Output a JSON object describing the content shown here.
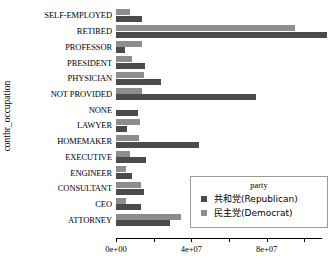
{
  "chart_data": {
    "type": "bar",
    "orientation": "horizontal",
    "title": "",
    "xlabel": "",
    "ylabel": "contbr_occupation",
    "xlim": [
      0,
      113000000
    ],
    "ylim": null,
    "grid": false,
    "legend_position": "bottom-right",
    "legend_title": "party",
    "xticks": [
      {
        "value": 0,
        "label": "0e+00"
      },
      {
        "value": 20000000,
        "label": ""
      },
      {
        "value": 40000000,
        "label": "4e+07"
      },
      {
        "value": 60000000,
        "label": ""
      },
      {
        "value": 80000000,
        "label": "8e+07"
      },
      {
        "value": 100000000,
        "label": ""
      }
    ],
    "categories": [
      "SELF-EMPLOYED",
      "RETIRED",
      "PROFESSOR",
      "PRESIDENT",
      "PHYSICIAN",
      "NOT PROVIDED",
      "NONE",
      "LAWYER",
      "HOMEMAKER",
      "EXECUTIVE",
      "ENGINEER",
      "CONSULTANT",
      "CEO",
      "ATTORNEY"
    ],
    "series": [
      {
        "name": "共和党(Republican)",
        "color": "#4b4b4b",
        "values": [
          13800000,
          112000000,
          5000000,
          15500000,
          23900000,
          74200000,
          11600000,
          6100000,
          44200000,
          16100000,
          8300000,
          15000000,
          13300000,
          28800000
        ]
      },
      {
        "name": "民主党(Democrat)",
        "color": "#8d8d8d",
        "values": [
          7700000,
          95000000,
          13800000,
          8300000,
          14900000,
          13800000,
          0,
          12700000,
          12200000,
          7700000,
          5500000,
          13300000,
          5500000,
          34400000
        ]
      }
    ]
  },
  "legend": {
    "title": "party",
    "entries": [
      {
        "label": "共和党(Republican)",
        "swatch": "#4b4b4b"
      },
      {
        "label": "民主党(Democrat)",
        "swatch": "#8d8d8d"
      }
    ]
  },
  "axes": {
    "y_title": "contbr_occupation"
  }
}
